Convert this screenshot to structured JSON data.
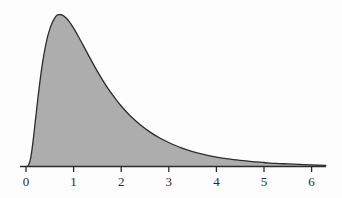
{
  "chart_data": {
    "type": "area",
    "title": "",
    "subtitle": "",
    "xlabel": "",
    "ylabel": "",
    "xlim": [
      0,
      6.3
    ],
    "ylim": [
      0,
      0.66
    ],
    "grid": false,
    "legend": false,
    "legend_position": "none",
    "xticks": [
      0,
      1,
      2,
      3,
      4,
      5,
      6
    ],
    "xtick_labels": [
      "0",
      "1",
      "2",
      "3",
      "4",
      "5",
      "6"
    ],
    "yticks": [],
    "ytick_labels": [],
    "peak": {
      "x": 0.65,
      "y": 0.645
    },
    "series": [
      {
        "name": "density",
        "fill_color": "#adadad",
        "line_color": "#2b2b2b",
        "x": [
          0.0,
          0.05,
          0.1,
          0.15,
          0.2,
          0.25,
          0.3,
          0.35,
          0.4,
          0.45,
          0.5,
          0.55,
          0.6,
          0.65,
          0.7,
          0.75,
          0.8,
          0.85,
          0.9,
          0.95,
          1.0,
          1.1,
          1.2,
          1.3,
          1.4,
          1.5,
          1.6,
          1.7,
          1.8,
          1.9,
          2.0,
          2.2,
          2.4,
          2.6,
          2.8,
          3.0,
          3.25,
          3.5,
          3.75,
          4.0,
          4.25,
          4.5,
          4.75,
          5.0,
          5.25,
          5.5,
          5.75,
          6.0,
          6.3
        ],
        "y": [
          0.0,
          0.004,
          0.038,
          0.11,
          0.2,
          0.29,
          0.372,
          0.443,
          0.501,
          0.548,
          0.583,
          0.61,
          0.629,
          0.642,
          0.645,
          0.644,
          0.638,
          0.629,
          0.617,
          0.603,
          0.587,
          0.552,
          0.515,
          0.477,
          0.44,
          0.404,
          0.37,
          0.338,
          0.309,
          0.282,
          0.257,
          0.213,
          0.177,
          0.147,
          0.122,
          0.102,
          0.08,
          0.063,
          0.05,
          0.04,
          0.032,
          0.026,
          0.021,
          0.017,
          0.013,
          0.011,
          0.009,
          0.007,
          0.005
        ]
      }
    ]
  },
  "axis": {
    "line_color": "#2b2b2b",
    "tick_color": "#2b2b2b",
    "labels": [
      {
        "text": "0",
        "value": 0
      },
      {
        "text": "1",
        "value": 1
      },
      {
        "text": "2",
        "value": 2
      },
      {
        "text": "3",
        "value": 3
      },
      {
        "text": "4",
        "value": 4
      },
      {
        "text": "5",
        "value": 5
      },
      {
        "text": "6",
        "value": 6
      }
    ]
  },
  "colors": {
    "background": "#fdfdfd",
    "fill": "#adadad",
    "stroke": "#2b2b2b",
    "text": "#2b2b2b"
  }
}
